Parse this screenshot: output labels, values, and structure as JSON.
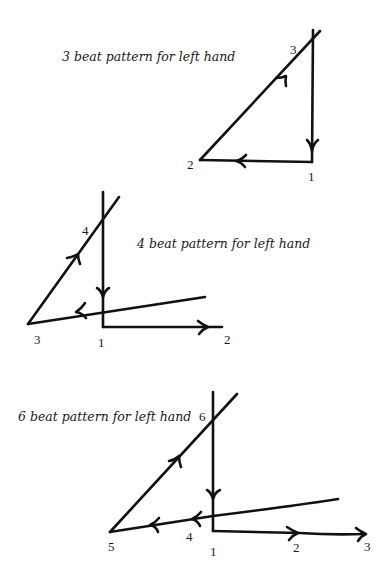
{
  "diagrams": [
    {
      "id": "three-beat",
      "caption": "3 beat pattern for left hand",
      "beats": [
        "1",
        "2",
        "3"
      ]
    },
    {
      "id": "four-beat",
      "caption": "4 beat pattern for left hand",
      "beats": [
        "1",
        "2",
        "3",
        "4"
      ]
    },
    {
      "id": "six-beat",
      "caption": "6 beat pattern for left hand",
      "beats": [
        "1",
        "2",
        "3",
        "4",
        "5",
        "6"
      ]
    }
  ],
  "colors": {
    "ink": "#111111",
    "background": "#ffffff"
  }
}
